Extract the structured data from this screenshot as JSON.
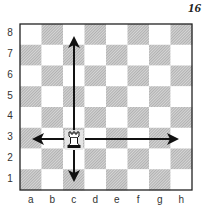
{
  "diagram": {
    "number": "16",
    "piece": {
      "type": "rook",
      "color": "white",
      "square": "c3",
      "icon": "rook-icon"
    },
    "arrows": [
      {
        "direction": "up",
        "from": "c3",
        "to": "c8"
      },
      {
        "direction": "down",
        "from": "c3",
        "to": "c1"
      },
      {
        "direction": "left",
        "from": "c3",
        "to": "a3"
      },
      {
        "direction": "right",
        "from": "c3",
        "to": "h3"
      }
    ]
  },
  "board": {
    "ranks": [
      "8",
      "7",
      "6",
      "5",
      "4",
      "3",
      "2",
      "1"
    ],
    "files": [
      "a",
      "b",
      "c",
      "d",
      "e",
      "f",
      "g",
      "h"
    ],
    "light_square_color": "#ffffff",
    "dark_square_hatch_color": "#9a9a9a",
    "border_color": "#222222"
  }
}
